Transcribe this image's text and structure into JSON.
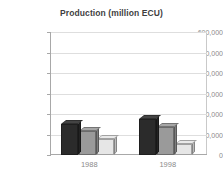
{
  "chart_data": {
    "type": "bar",
    "title": "Production (million ECU)",
    "xlabel": "",
    "ylabel": "",
    "categories": [
      "1988",
      "1998"
    ],
    "ylim": [
      0,
      600000
    ],
    "yticks": [
      0,
      100000,
      200000,
      300000,
      400000,
      500000,
      600000
    ],
    "ytick_labels": [
      "0",
      "100,000",
      "200,000",
      "300,000",
      "400,000",
      "500,000",
      "600,000"
    ],
    "grid": true,
    "legend": "none",
    "series": [
      {
        "name": "series-1",
        "color": "#2b2b2b",
        "values": [
          150000,
          175000
        ]
      },
      {
        "name": "series-2",
        "color": "#9a9a9a",
        "values": [
          115000,
          135000
        ]
      },
      {
        "name": "series-3",
        "color": "#e6e6e6",
        "values": [
          80000,
          55000
        ]
      }
    ]
  },
  "colors": {
    "background": "#ffffff",
    "title_text": "#3f3f3f",
    "tick_text": "#8a8a8a",
    "gridline": "#dedede",
    "axis": "#a8a8a8",
    "frame": "#c9c9c9"
  }
}
